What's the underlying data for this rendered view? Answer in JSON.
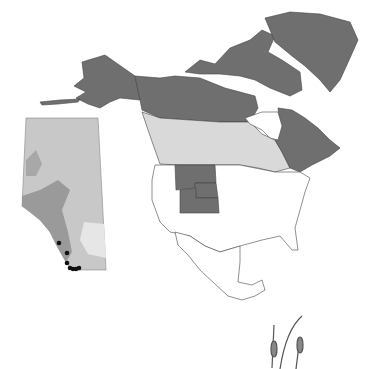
{
  "map": {
    "title": "",
    "colors": {
      "present_region": "#6f6f6f",
      "range_region": "#d9d9d9",
      "absent_region": "#ffffff",
      "border": "#444444",
      "inset_base": "#c8c8c8",
      "inset_dark": "#9a9a9a",
      "inset_light": "#e6e6e6",
      "occurrence_point": "#111111"
    },
    "regions_present": [
      "Alaska",
      "Yukon",
      "Northwest Territories",
      "Nunavut",
      "Quebec",
      "Newfoundland and Labrador",
      "Greenland",
      "Montana",
      "Idaho",
      "Wyoming",
      "Utah",
      "Colorado"
    ],
    "regions_light": [
      "British Columbia",
      "Alberta",
      "Saskatchewan",
      "Manitoba",
      "Ontario"
    ],
    "inset": {
      "region": "Alberta",
      "occurrence_points": 7
    },
    "decorations": {
      "icon": "grass-seedhead-icon"
    }
  }
}
